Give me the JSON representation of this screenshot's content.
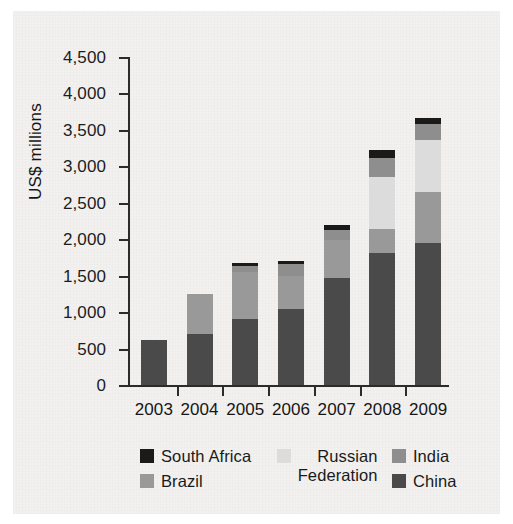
{
  "chart_data": {
    "type": "bar",
    "stacked": true,
    "title": "",
    "subtitle": "",
    "xlabel": "",
    "ylabel": "US$ millions",
    "ylim": [
      0,
      4500
    ],
    "ytick_labels": [
      "0",
      "500",
      "1,000",
      "1,500",
      "2,000",
      "2,500",
      "3,000",
      "3,500",
      "4,000",
      "4,500"
    ],
    "ytick_values": [
      0,
      500,
      1000,
      1500,
      2000,
      2500,
      3000,
      3500,
      4000,
      4500
    ],
    "grid": false,
    "legend_position": "bottom",
    "categories": [
      "2003",
      "2004",
      "2005",
      "2006",
      "2007",
      "2008",
      "2009"
    ],
    "series": [
      {
        "name": "China",
        "color": "#4a4a4a",
        "values": [
          615,
          705,
          900,
          1040,
          1475,
          1810,
          1950
        ]
      },
      {
        "name": "Brazil",
        "color": "#999999",
        "values": [
          0,
          540,
          655,
          460,
          510,
          330,
          705
        ]
      },
      {
        "name": "Russian Federation",
        "color": "#dcdcdc",
        "values": [
          0,
          0,
          0,
          0,
          0,
          710,
          705
        ]
      },
      {
        "name": "India",
        "color": "#8e8e8e",
        "values": [
          0,
          0,
          75,
          155,
          140,
          270,
          220
        ]
      },
      {
        "name": "South Africa",
        "color": "#1a1a1a",
        "values": [
          0,
          0,
          50,
          50,
          75,
          100,
          90
        ]
      }
    ],
    "totals": [
      615,
      1245,
      1680,
      1840,
      2340,
      3220,
      3920
    ]
  },
  "axes": {
    "y_title": "US$ millions"
  },
  "legend": {
    "columns": [
      {
        "items": [
          {
            "label": "South Africa",
            "color": "#1a1a1a",
            "icon": "legend-swatch-icon"
          },
          {
            "label": "Brazil",
            "color": "#999999",
            "icon": "legend-swatch-icon"
          }
        ]
      },
      {
        "items": [
          {
            "label": "Russian\nFederation",
            "color": "#dcdcdc",
            "icon": "legend-swatch-icon"
          }
        ]
      },
      {
        "items": [
          {
            "label": "India",
            "color": "#8e8e8e",
            "icon": "legend-swatch-icon"
          },
          {
            "label": "China",
            "color": "#4a4a4a",
            "icon": "legend-swatch-icon"
          }
        ]
      }
    ]
  }
}
